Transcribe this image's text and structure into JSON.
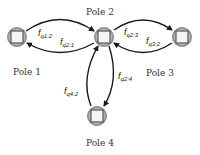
{
  "diagram": {
    "type": "pole-flow-graph",
    "nodes": [
      {
        "id": "pole1",
        "label": "Pole 1"
      },
      {
        "id": "pole2",
        "label": "Pole 2"
      },
      {
        "id": "pole3",
        "label": "Pole 3"
      },
      {
        "id": "pole4",
        "label": "Pole 4"
      }
    ],
    "edges": [
      {
        "from": "pole1",
        "to": "pole2",
        "label_main": "f",
        "label_sub": "q1:2"
      },
      {
        "from": "pole2",
        "to": "pole1",
        "label_main": "f",
        "label_sub": "q2:1"
      },
      {
        "from": "pole2",
        "to": "pole3",
        "label_main": "f",
        "label_sub": "q2:3"
      },
      {
        "from": "pole3",
        "to": "pole2",
        "label_main": "f",
        "label_sub": "q3:2"
      },
      {
        "from": "pole2",
        "to": "pole4",
        "label_main": "f",
        "label_sub": "q2:4"
      },
      {
        "from": "pole4",
        "to": "pole2",
        "label_main": "f",
        "label_sub": "q4:2"
      }
    ],
    "colors": {
      "edge": "#1a1a1a",
      "node_ring": "#8a8a8a",
      "node_fill": "#f2f2f2",
      "node_square": "#555555"
    }
  }
}
